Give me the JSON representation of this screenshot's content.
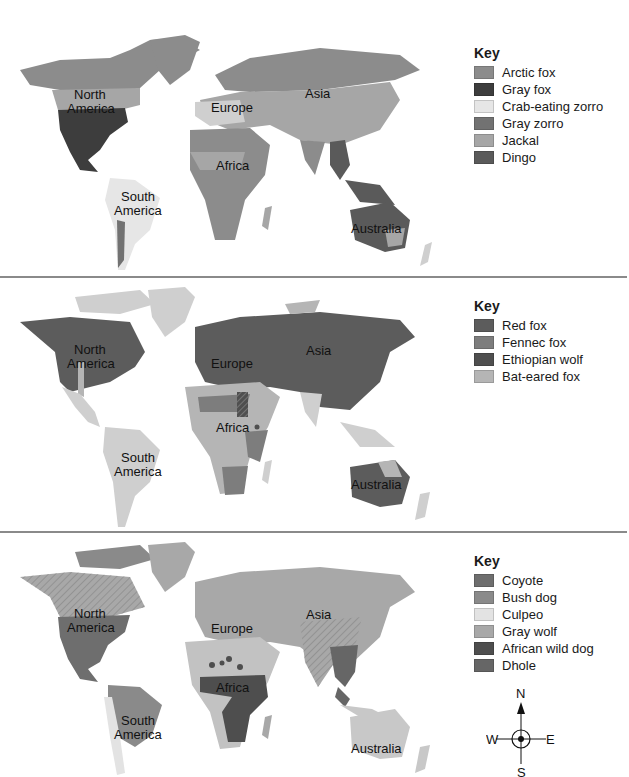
{
  "header": {
    "title_clipped": ""
  },
  "colors": {
    "land_default": "#cfcfcf",
    "divider": "#8a8a8a"
  },
  "continent_labels": {
    "north_america_1": "North",
    "north_america_2": "America",
    "south_america_1": "South",
    "south_america_2": "America",
    "europe": "Europe",
    "asia": "Asia",
    "africa": "Africa",
    "australia": "Australia"
  },
  "maps": [
    {
      "key_title": "Key",
      "legend": [
        {
          "label": "Arctic fox",
          "color": "#8c8c8c"
        },
        {
          "label": "Gray fox",
          "color": "#3d3d3d"
        },
        {
          "label": "Crab-eating zorro",
          "color": "#e6e6e6"
        },
        {
          "label": "Gray zorro",
          "color": "#727272"
        },
        {
          "label": "Jackal",
          "color": "#a6a6a6"
        },
        {
          "label": "Dingo",
          "color": "#5a5a5a"
        }
      ]
    },
    {
      "key_title": "Key",
      "legend": [
        {
          "label": "Red fox",
          "color": "#5c5c5c"
        },
        {
          "label": "Fennec fox",
          "color": "#7d7d7d"
        },
        {
          "label": "Ethiopian wolf",
          "color": "#4f4f4f"
        },
        {
          "label": "Bat-eared fox",
          "color": "#b5b5b5"
        }
      ]
    },
    {
      "key_title": "Key",
      "legend": [
        {
          "label": "Coyote",
          "color": "#6e6e6e"
        },
        {
          "label": "Bush dog",
          "color": "#8a8a8a"
        },
        {
          "label": "Culpeo",
          "color": "#e3e3e3"
        },
        {
          "label": "Gray wolf",
          "color": "#a8a8a8"
        },
        {
          "label": "African wild dog",
          "color": "#4e4e4e"
        },
        {
          "label": "Dhole",
          "color": "#666666"
        }
      ]
    }
  ],
  "compass": {
    "n": "N",
    "s": "S",
    "e": "E",
    "w": "W"
  }
}
